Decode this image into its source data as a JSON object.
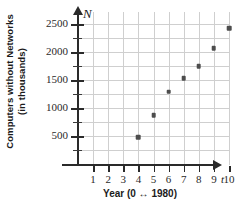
{
  "chart_data": {
    "type": "scatter",
    "title": "",
    "xlabel": "Year (0 ↔ 1980)",
    "ylabel_line1": "Computers without Networks",
    "ylabel_line2": "(in thousands)",
    "x_axis_variable": "t",
    "y_axis_variable": "N",
    "x": [
      4,
      5,
      6,
      7,
      8,
      9,
      10
    ],
    "values": [
      480,
      870,
      1290,
      1530,
      1750,
      2070,
      2420
    ],
    "xlim": [
      0,
      10.6
    ],
    "ylim": [
      0,
      2650
    ],
    "x_ticks": [
      1,
      2,
      3,
      4,
      5,
      6,
      7,
      8,
      9,
      10
    ],
    "x_tick_labels": [
      "1",
      "2",
      "3",
      "4",
      "5",
      "6",
      "7",
      "8",
      "9",
      "10"
    ],
    "y_ticks_major": [
      500,
      1000,
      1500,
      2000,
      2500
    ],
    "y_tick_labels": [
      "500",
      "1000",
      "1500",
      "2000",
      "2500"
    ],
    "y_ticks_minor": [
      250,
      750,
      1250,
      1750,
      2250
    ],
    "grid": true,
    "grid_color": "#cfcfcf",
    "axis_color": "#2a2a2a",
    "point_color": "#4d4d4d",
    "legend": "none"
  }
}
